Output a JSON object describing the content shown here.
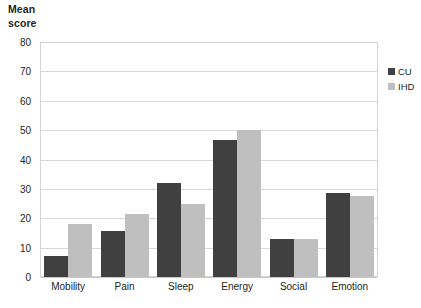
{
  "chart_data": {
    "type": "bar",
    "title": "Mean\nscore",
    "xlabel": "",
    "ylabel": "Mean score",
    "categories": [
      "Mobility",
      "Pain",
      "Sleep",
      "Energy",
      "Social",
      "Emotion"
    ],
    "series": [
      {
        "name": "CU",
        "color": "#404040",
        "values": [
          7,
          15.5,
          32,
          46.5,
          13,
          28.7
        ]
      },
      {
        "name": "IHD",
        "color": "#bfbfbf",
        "values": [
          18,
          21.5,
          25,
          50,
          13,
          27.7
        ]
      }
    ],
    "ylim": [
      0,
      80
    ],
    "ytick_step": 10,
    "yticks": [
      "0",
      "10",
      "20",
      "30",
      "40",
      "50",
      "60",
      "70",
      "80"
    ],
    "grid": true,
    "legend_position": "right",
    "legend": [
      "CU",
      "IHD"
    ]
  }
}
